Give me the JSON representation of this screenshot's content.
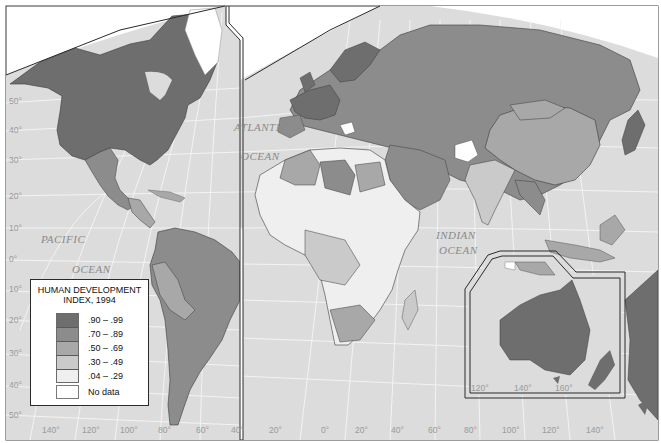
{
  "map": {
    "title": "Human Development Index, 1994",
    "colors": {
      "ocean": "#dcdcdc",
      "graticule": "#f2f2f2",
      "border_dark": "#3a3a3a",
      "very_high": "#6e6e6e",
      "high": "#8c8c8c",
      "medium": "#a8a8a8",
      "low": "#cacaca",
      "very_low": "#efefef",
      "no_data": "#ffffff"
    },
    "ocean_labels": [
      {
        "text": "ATLANTIC",
        "x": 234,
        "y": 131
      },
      {
        "text": "OCEAN",
        "x": 241,
        "y": 160
      },
      {
        "text": "PACIFIC",
        "x": 41,
        "y": 243
      },
      {
        "text": "OCEAN",
        "x": 72,
        "y": 273
      },
      {
        "text": "INDIAN",
        "x": 436,
        "y": 239
      },
      {
        "text": "OCEAN",
        "x": 439,
        "y": 254
      }
    ],
    "latitude_ticks": [
      "50°",
      "40°",
      "30°",
      "20°",
      "10°",
      "0°",
      "10°",
      "20°",
      "30°",
      "40°",
      "50°"
    ],
    "longitude_ticks_left": [
      "140°",
      "120°",
      "100°",
      "80°",
      "60°",
      "40°",
      "20°"
    ],
    "longitude_ticks_right": [
      "0°",
      "20°",
      "40°",
      "60°",
      "80°",
      "100°",
      "120°",
      "140°"
    ],
    "inset_longitude_ticks": [
      "120°",
      "140°",
      "160°"
    ]
  },
  "legend": {
    "title_line1": "HUMAN DEVELOPMENT",
    "title_line2": "INDEX, 1994",
    "items": [
      {
        "label": ".90 – .99",
        "color": "#6e6e6e"
      },
      {
        "label": ".70 – .89",
        "color": "#8c8c8c"
      },
      {
        "label": ".50 – .69",
        "color": "#a8a8a8"
      },
      {
        "label": ".30 – .49",
        "color": "#cacaca"
      },
      {
        "label": ".04 – .29",
        "color": "#efefef"
      }
    ],
    "no_data_label": "No data"
  }
}
